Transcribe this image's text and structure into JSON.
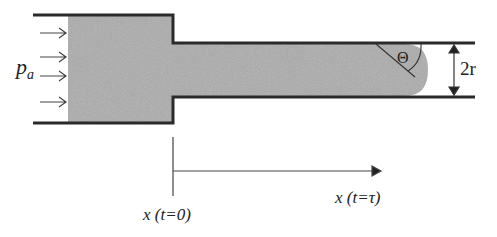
{
  "diagram": {
    "labels": {
      "pressure": "p",
      "pressure_sub": "a",
      "angle": "Θ",
      "radius": "2r",
      "x_start": "x (t=0)",
      "x_end": "x (t=τ)"
    },
    "colors": {
      "fluid": "#a9a9a9",
      "wall": "#2a2a2a",
      "line": "#444444"
    }
  }
}
